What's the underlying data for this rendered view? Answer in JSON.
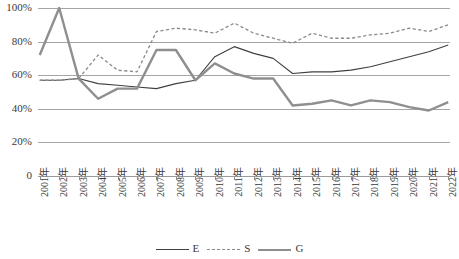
{
  "chart_data": {
    "type": "line",
    "title": "",
    "subtitle": "",
    "xlabel": "",
    "ylabel": "",
    "grid": true,
    "legend_position": "bottom",
    "ylim": [
      0,
      1.0
    ],
    "ytick_labels": [
      "100%",
      "80%",
      "60%",
      "40%",
      "20%",
      "0"
    ],
    "ytick_values": [
      1.0,
      0.8,
      0.6,
      0.4,
      0.2,
      0.0
    ],
    "categories": [
      "2001年",
      "2002年",
      "2003年",
      "2004年",
      "2005年",
      "2006年",
      "2007年",
      "2008年",
      "2009年",
      "2010年",
      "2011年",
      "2012年",
      "2013年",
      "2014年",
      "2015年",
      "2016年",
      "2017年",
      "2018年",
      "2019年",
      "2020年",
      "2021年",
      "2022年"
    ],
    "series": [
      {
        "name": "E",
        "style": "solid-thin",
        "color": "#404040",
        "values": [
          0.57,
          0.57,
          0.58,
          0.55,
          0.54,
          0.53,
          0.52,
          0.55,
          0.57,
          0.71,
          0.77,
          0.73,
          0.7,
          0.61,
          0.62,
          0.62,
          0.63,
          0.65,
          0.68,
          0.71,
          0.74,
          0.78
        ]
      },
      {
        "name": "S",
        "style": "dashed",
        "color": "#8a8a8a",
        "values": [
          0.57,
          0.57,
          0.58,
          0.72,
          0.63,
          0.62,
          0.86,
          0.88,
          0.87,
          0.85,
          0.91,
          0.85,
          0.82,
          0.79,
          0.85,
          0.82,
          0.82,
          0.84,
          0.85,
          0.88,
          0.86,
          0.9
        ]
      },
      {
        "name": "G",
        "style": "solid-thick",
        "color": "#8f8f8f",
        "values": [
          0.72,
          1.0,
          0.58,
          0.46,
          0.52,
          0.52,
          0.75,
          0.75,
          0.57,
          0.67,
          0.61,
          0.58,
          0.58,
          0.42,
          0.43,
          0.45,
          0.42,
          0.45,
          0.44,
          0.41,
          0.39,
          0.44
        ]
      }
    ]
  },
  "legend": {
    "entries": [
      {
        "label": "E"
      },
      {
        "label": "S"
      },
      {
        "label": "G"
      }
    ]
  }
}
